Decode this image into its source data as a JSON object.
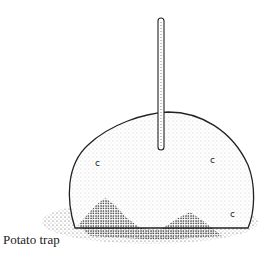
{
  "caption": "Potato trap",
  "illustration": {
    "subject": "potato with stick inserted, resting on ground",
    "style": "stippled ink drawing",
    "ink_color": "#1a1a1a"
  }
}
